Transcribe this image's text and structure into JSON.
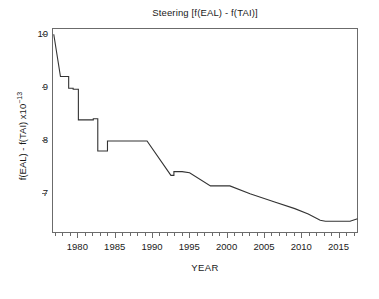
{
  "chart_data": {
    "type": "line",
    "title": "Steering [f(EAL) - f(TAI)]",
    "xlabel": "YEAR",
    "ylabel_main": "f(EAL) - f(TAI) x10",
    "ylabel_exponent": "−13",
    "xlim": [
      1976.6,
      2017.6
    ],
    "ylim": [
      6.24,
      10.12
    ],
    "grid": false,
    "legend": null,
    "xticks": [
      1980,
      1985,
      1990,
      1995,
      2000,
      2005,
      2010,
      2015
    ],
    "xtick_labels": [
      "1980",
      "1985",
      "1990",
      "1995",
      "2000",
      "2005",
      "2010",
      "2015"
    ],
    "xminor_step": 1,
    "yticks": [
      7,
      8,
      9,
      10
    ],
    "ytick_labels": [
      "7",
      "8",
      "9",
      "10"
    ],
    "series": [
      {
        "name": "f(EAL) - f(TAI)",
        "color": "#333333",
        "linewidth": 1.1,
        "x": [
          1976.7,
          1977.6,
          1977.6,
          1978.7,
          1978.7,
          1979.3,
          1979.3,
          1980.0,
          1980.0,
          1982.0,
          1982.0,
          1982.6,
          1982.6,
          1983.9,
          1983.9,
          1989.2,
          1992.4,
          1992.8,
          1992.8,
          1993.9,
          1994.9,
          1997.7,
          1998.1,
          2000.3,
          2003.0,
          2006.2,
          2009.0,
          2010.8,
          2012.4,
          2013.1,
          2016.4,
          2017.4
        ],
        "y": [
          10.02,
          9.22,
          9.22,
          9.22,
          9.0,
          9.0,
          8.98,
          8.98,
          8.4,
          8.4,
          8.42,
          8.42,
          7.81,
          7.81,
          8.0,
          8.0,
          7.35,
          7.35,
          7.42,
          7.42,
          7.4,
          7.15,
          7.15,
          7.15,
          7.0,
          6.85,
          6.72,
          6.62,
          6.5,
          6.48,
          6.48,
          6.53
        ]
      }
    ]
  }
}
